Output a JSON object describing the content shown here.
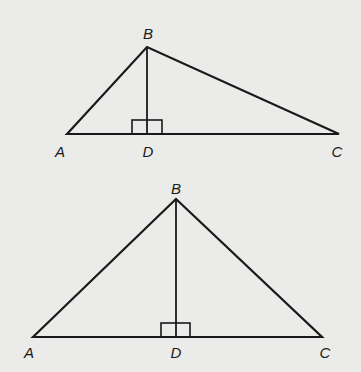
{
  "figures": [
    {
      "id": "triangle-top",
      "points": {
        "A": [
          67,
          134
        ],
        "B": [
          147,
          47
        ],
        "C": [
          339,
          134
        ],
        "D": [
          147,
          134
        ]
      },
      "right_angle": {
        "x": 132,
        "y": 120,
        "w": 30,
        "h": 14
      },
      "labels": [
        {
          "text": "B",
          "x": 148,
          "y": 33
        },
        {
          "text": "A",
          "x": 60,
          "y": 151
        },
        {
          "text": "D",
          "x": 148,
          "y": 151
        },
        {
          "text": "C",
          "x": 337,
          "y": 151
        }
      ]
    },
    {
      "id": "triangle-bottom",
      "points": {
        "A": [
          33,
          337
        ],
        "B": [
          176,
          199
        ],
        "C": [
          322,
          337
        ],
        "D": [
          176,
          337
        ]
      },
      "right_angle": {
        "x": 161,
        "y": 323,
        "w": 29,
        "h": 14
      },
      "labels": [
        {
          "text": "B",
          "x": 176,
          "y": 188
        },
        {
          "text": "A",
          "x": 29,
          "y": 352
        },
        {
          "text": "D",
          "x": 176,
          "y": 352
        },
        {
          "text": "C",
          "x": 325,
          "y": 352
        }
      ]
    }
  ],
  "style": {
    "stroke": "#1a1a1a",
    "stroke_width": 2.2,
    "background": "#ebebea"
  }
}
